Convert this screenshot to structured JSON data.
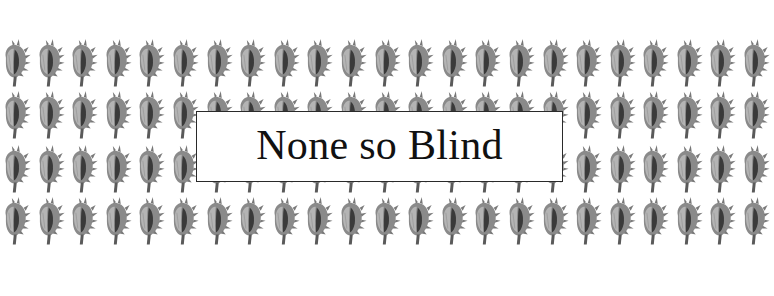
{
  "banner": {
    "title": "None so Blind",
    "background_pattern": {
      "icon": "conch-shell-icon",
      "rows": 4,
      "columns": 23,
      "color": "#6e6e6e",
      "background": "#ffffff"
    },
    "box": {
      "background": "#ffffff",
      "border_color": "#2a2a2a"
    }
  }
}
